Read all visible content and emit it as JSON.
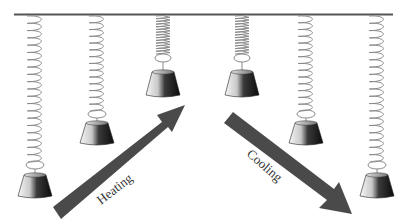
{
  "diagram": {
    "title": "",
    "labels": {
      "heating": "Heating",
      "cooling": "Cooling"
    },
    "colors": {
      "bar": "#555555",
      "spring": "#8a8a8a",
      "arrow": "#4a4a4a",
      "weight_dark": "#111111",
      "weight_light": "#f4f4f4"
    },
    "springs": [
      {
        "id": 1,
        "x": 35,
        "length": "long",
        "spring_bottom": 168,
        "weight_top": 173,
        "weight_bottom": 198
      },
      {
        "id": 2,
        "x": 97,
        "length": "medium",
        "spring_bottom": 117,
        "weight_top": 121,
        "weight_bottom": 145
      },
      {
        "id": 3,
        "x": 163,
        "length": "short",
        "spring_bottom": 63,
        "weight_top": 70,
        "weight_bottom": 97
      },
      {
        "id": 4,
        "x": 242,
        "length": "short",
        "spring_bottom": 63,
        "weight_top": 70,
        "weight_bottom": 97
      },
      {
        "id": 5,
        "x": 306,
        "length": "medium",
        "spring_bottom": 117,
        "weight_top": 121,
        "weight_bottom": 145
      },
      {
        "id": 6,
        "x": 377,
        "length": "long",
        "spring_bottom": 168,
        "weight_top": 173,
        "weight_bottom": 198
      }
    ],
    "arrows": [
      {
        "name": "heating",
        "from": [
          57,
          213
        ],
        "to": [
          182,
          116
        ]
      },
      {
        "name": "cooling",
        "from": [
          229,
          118
        ],
        "to": [
          352,
          212
        ]
      }
    ]
  }
}
